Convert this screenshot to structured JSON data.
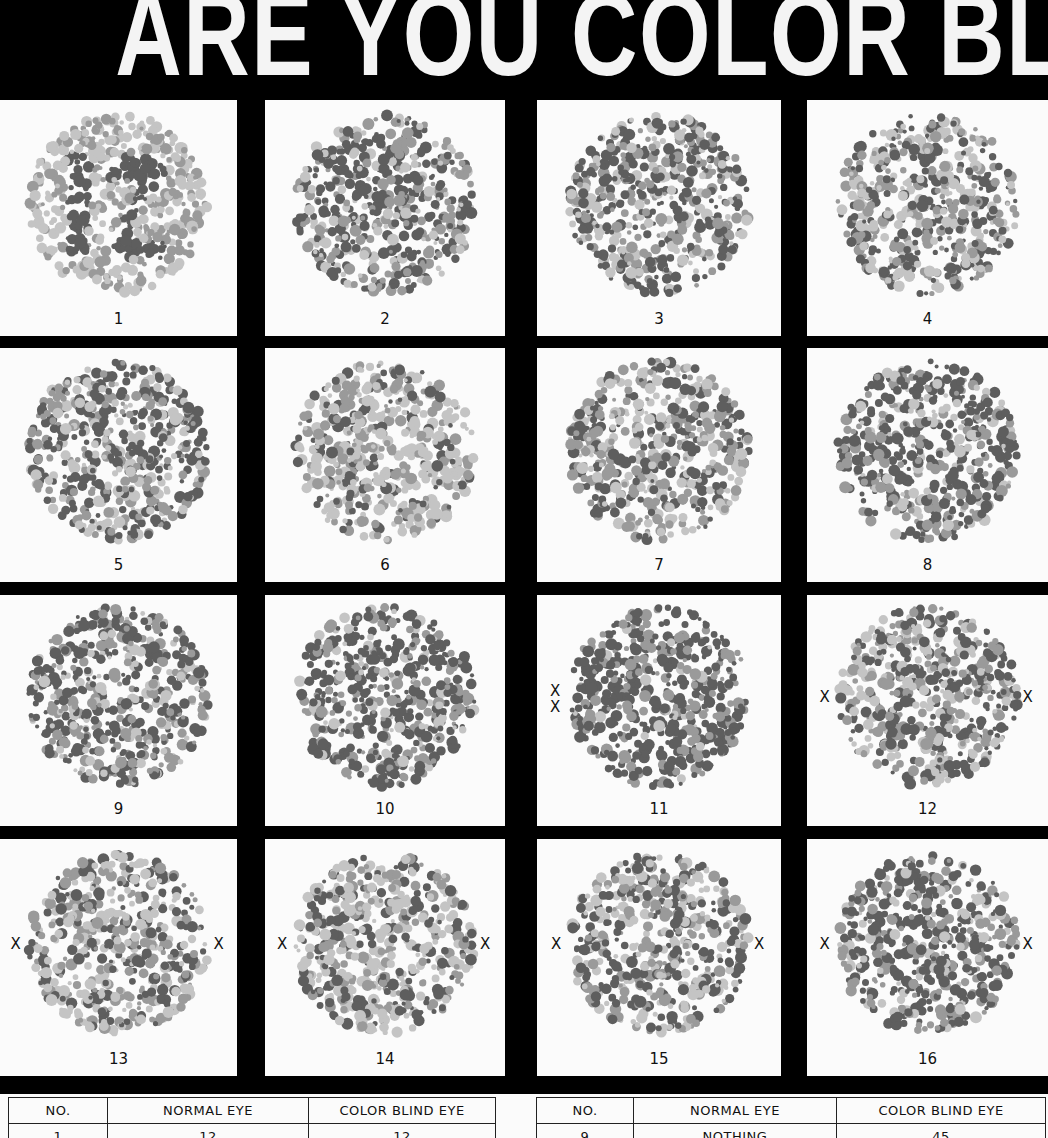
{
  "title": "ARE YOU COLOR BLIND?",
  "colors": {
    "background": "#000000",
    "panel": "#fbfbfb",
    "dot_light": "#c4c4c4",
    "dot_mid": "#9a9a9a",
    "dot_dark": "#5e5e5e"
  },
  "plates": [
    {
      "number": "1",
      "marks": []
    },
    {
      "number": "2",
      "marks": []
    },
    {
      "number": "3",
      "marks": []
    },
    {
      "number": "4",
      "marks": []
    },
    {
      "number": "5",
      "marks": []
    },
    {
      "number": "6",
      "marks": []
    },
    {
      "number": "7",
      "marks": []
    },
    {
      "number": "8",
      "marks": []
    },
    {
      "number": "9",
      "marks": []
    },
    {
      "number": "10",
      "marks": []
    },
    {
      "number": "11",
      "marks": [
        "X",
        "X"
      ]
    },
    {
      "number": "12",
      "marks": [
        "X",
        "X"
      ]
    },
    {
      "number": "13",
      "marks": [
        "X",
        "X"
      ]
    },
    {
      "number": "14",
      "marks": [
        "X",
        "X"
      ]
    },
    {
      "number": "15",
      "marks": [
        "X",
        "X"
      ]
    },
    {
      "number": "16",
      "marks": [
        "X",
        "X"
      ]
    }
  ],
  "plate1_figure": "12",
  "answer_key": {
    "left": {
      "headers": [
        "NO.",
        "NORMAL EYE",
        "COLOR BLIND EYE"
      ],
      "rows": [
        [
          "1",
          "12",
          "12"
        ]
      ]
    },
    "right": {
      "headers": [
        "NO.",
        "NORMAL EYE",
        "COLOR BLIND EYE"
      ],
      "rows": [
        [
          "9",
          "NOTHING",
          "45"
        ]
      ]
    }
  }
}
